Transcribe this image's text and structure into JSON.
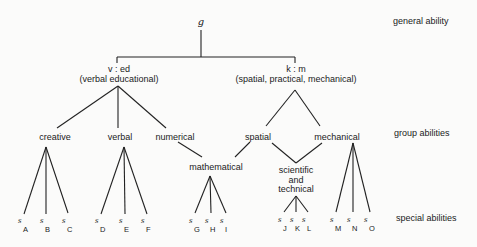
{
  "root": {
    "label": "g"
  },
  "level_labels": {
    "general": "general ability",
    "group": "group abilities",
    "special": "special abilities"
  },
  "major_factors": [
    {
      "symbol": "v : ed",
      "description": "(verbal educational)"
    },
    {
      "symbol": "k : m",
      "description": "(spatial, practical, mechanical)"
    }
  ],
  "group_factors": {
    "creative": "creative",
    "verbal": "verbal",
    "numerical": "numerical",
    "spatial": "spatial",
    "mechanical": "mechanical",
    "mathematical": "mathematical",
    "scientific_technical": [
      "scientific",
      "and",
      "technical"
    ]
  },
  "special_abilities": {
    "symbol": "s",
    "subscripts": [
      "A",
      "B",
      "C",
      "D",
      "E",
      "F",
      "G",
      "H",
      "I",
      "J",
      "K",
      "L",
      "M",
      "N",
      "O"
    ]
  }
}
